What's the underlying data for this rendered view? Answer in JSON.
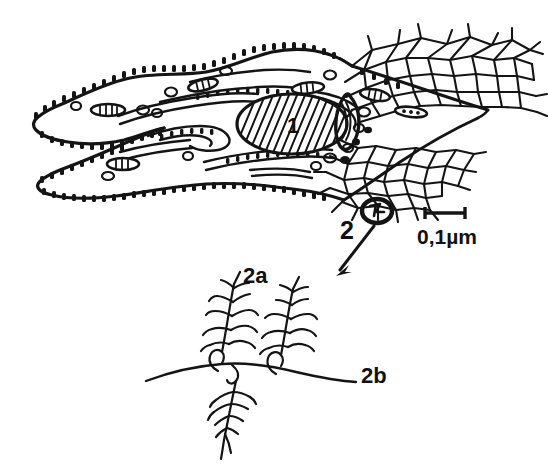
{
  "figure": {
    "domain": "scientific-line-drawing",
    "background_color": "#ffffff",
    "ink_color": "#141414",
    "width": 548,
    "height": 466,
    "caption_present": false
  },
  "labels": {
    "nucleus": "1",
    "surface_unit": "2",
    "branch_upper": "2a",
    "backbone": "2b"
  },
  "scale_bar": {
    "text": "0,1µm",
    "bar_length_px": 40,
    "x_start": 425,
    "x_end": 465,
    "y": 213
  },
  "annotations": {
    "arrow": {
      "name": "magnification-arrow",
      "from_x": 374,
      "from_y": 226,
      "to_x": 338,
      "to_y": 272
    },
    "circle_marker": {
      "name": "circled-surface-unit",
      "cx": 377,
      "cy": 211,
      "rx": 15,
      "ry": 12
    }
  },
  "parts": {
    "cell_body": "ribosome-studded-cell-outline",
    "nucleus": "hatched-oval-nucleus",
    "mesh": "polygonal-surface-mesh",
    "detail_panel": "surface-layer-detail",
    "feather_left": "branched-unit-left",
    "feather_right": "branched-unit-right",
    "feather_lower": "branched-unit-lower"
  }
}
